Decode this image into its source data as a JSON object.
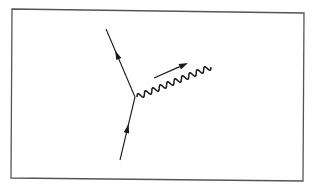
{
  "diagram": {
    "type": "feynman-vertex",
    "colors": {
      "ink": "#1a1a1a",
      "frame": "#555555",
      "background": "#ffffff"
    },
    "frame": {
      "tl": [
        12,
        9
      ],
      "tr": [
        304,
        13
      ],
      "br": [
        303,
        181
      ],
      "bl": [
        11,
        178
      ]
    },
    "vertex": [
      135,
      97
    ],
    "incoming_fermion": {
      "from": [
        120,
        160
      ],
      "to": [
        135,
        97
      ],
      "arrow_at": 0.5,
      "direction": "toward-vertex"
    },
    "outgoing_fermion": {
      "from": [
        135,
        97
      ],
      "to": [
        106,
        29
      ],
      "arrow_at": 0.62,
      "direction": "away-from-vertex"
    },
    "photon": {
      "from": [
        137,
        97
      ],
      "to": [
        211,
        67
      ],
      "waves": 10,
      "amplitude": 2.6
    },
    "momentum_arrow": {
      "from": [
        154,
        78
      ],
      "to": [
        188,
        63
      ]
    }
  }
}
